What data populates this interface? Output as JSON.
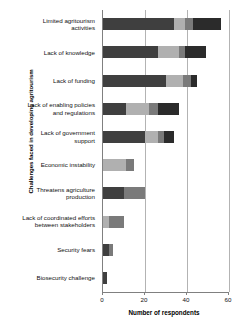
{
  "chart_data": {
    "type": "bar",
    "orientation": "horizontal",
    "stacked": true,
    "title": "",
    "xlabel": "Number of respondents",
    "ylabel": "Challenges faced in developing agritourism",
    "xlim": [
      0,
      60
    ],
    "xticks": [
      0,
      20,
      40,
      60
    ],
    "xtick_labels": [
      "0",
      "20",
      "40",
      "60"
    ],
    "grid": "vertical",
    "legend": "none",
    "categories": [
      "Limited agritourism activities",
      "Lack of knowledge",
      "Lack of funding",
      "Lack of enabling policies and regulations",
      "Lack of government support",
      "Economic instability",
      "Threatens agriculture production",
      "Lack of coordinated efforts between stakeholders",
      "Security fears",
      "Biosecurity challenge"
    ],
    "category_lines": [
      [
        "Limited agritourism",
        "activities"
      ],
      [
        "Lack of knowledge"
      ],
      [
        "Lack of funding"
      ],
      [
        "Lack of enabling policies",
        "and regulations"
      ],
      [
        "Lack of government",
        "support"
      ],
      [
        "Economic instability"
      ],
      [
        "Threatens agriculture",
        "production"
      ],
      [
        "Lack of coordinated efforts",
        "between stakeholders"
      ],
      [
        "Security fears"
      ],
      [
        "Biosecurity challenge"
      ]
    ],
    "series": [
      {
        "name": "Segment 1",
        "color": "#3f3f3f",
        "values": [
          34,
          26,
          30,
          11,
          20,
          0,
          10,
          0,
          3,
          2
        ]
      },
      {
        "name": "Segment 2",
        "color": "#b0b0b0",
        "values": [
          5,
          10,
          8,
          11,
          6,
          11,
          0,
          3,
          0,
          0
        ]
      },
      {
        "name": "Segment 3",
        "color": "#7a7a7a",
        "values": [
          4,
          3,
          4,
          4,
          3,
          4,
          10,
          7,
          2,
          0
        ]
      },
      {
        "name": "Segment 4",
        "color": "#2b2b2b",
        "values": [
          13,
          10,
          3,
          10,
          5,
          0,
          0,
          0,
          0,
          0
        ]
      }
    ],
    "totals": [
      56,
      49,
      45,
      36,
      34,
      15,
      20,
      10,
      5,
      2
    ],
    "colors": {
      "axis": "#808080",
      "grid": "#b3b3b3",
      "text": "#111111",
      "background": "#ffffff"
    }
  }
}
